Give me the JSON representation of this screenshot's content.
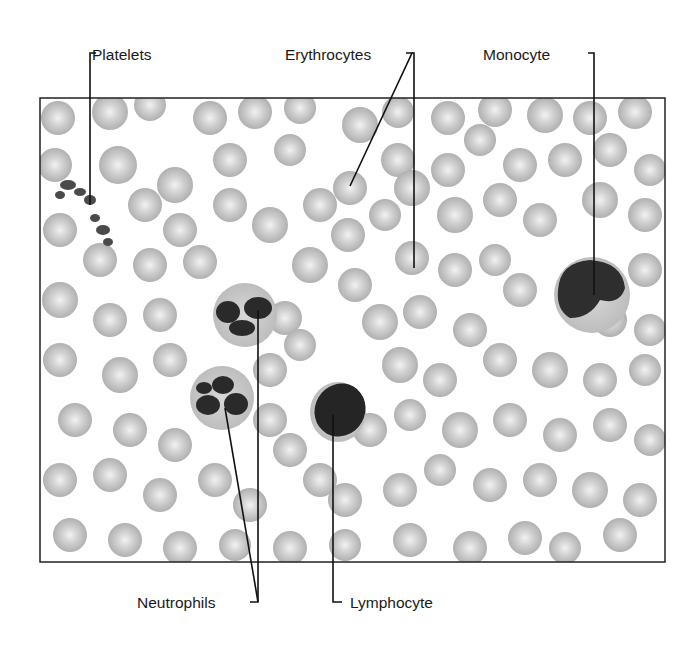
{
  "figure": {
    "frame": {
      "x": 40,
      "y": 98,
      "width": 625,
      "height": 464
    },
    "colors": {
      "background": "#ffffff",
      "erythrocyte": "#b8b8b8",
      "erythrocyte_center": "#ececec",
      "nucleus": "#2a2a2a",
      "cytoplasm": "#c9c9c9",
      "leader_line": "#111111",
      "frame": "#222222"
    },
    "labels": [
      {
        "id": "platelets",
        "text": "Platelets",
        "x": 92,
        "y": 47
      },
      {
        "id": "erythrocytes",
        "text": "Erythrocytes",
        "x": 285,
        "y": 47
      },
      {
        "id": "monocyte",
        "text": "Monocyte",
        "x": 483,
        "y": 47
      },
      {
        "id": "neutrophils",
        "text": "Neutrophils",
        "x": 137,
        "y": 595
      },
      {
        "id": "lymphocyte",
        "text": "Lymphocyte",
        "x": 350,
        "y": 595
      }
    ]
  }
}
